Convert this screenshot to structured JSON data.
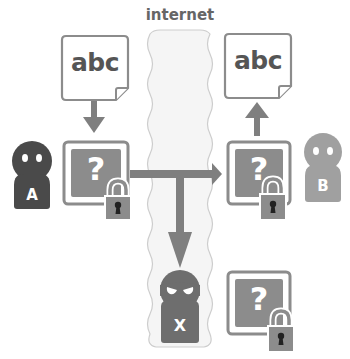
{
  "internet": {
    "label": "internet"
  },
  "sender": {
    "label": "A",
    "color": "#4a4a4a"
  },
  "receiver": {
    "label": "B",
    "color": "#a0a0a0"
  },
  "eavesdropper": {
    "label": "X",
    "color": "#6e6e6e"
  },
  "message": {
    "plain_text": "abc",
    "encrypted_symbol": "?"
  },
  "colors": {
    "arrow": "#7f7f7f",
    "box_fill": "#8c8c8c",
    "box_border": "#8c8c8c",
    "doc_border": "#8c8c8c",
    "internet_fill": "#f4f4f4",
    "internet_border": "#cfcfcf",
    "text": "#555555"
  }
}
